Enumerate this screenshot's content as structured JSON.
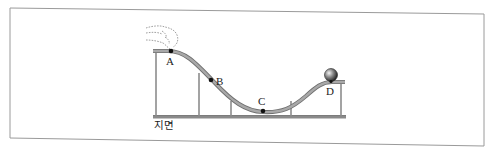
{
  "diagram": {
    "type": "roller-coaster track diagram",
    "points": [
      {
        "id": "A",
        "label": "A",
        "description": "start point on top-left platform, hand releasing ball"
      },
      {
        "id": "B",
        "label": "B",
        "description": "point on descending slope"
      },
      {
        "id": "C",
        "label": "C",
        "description": "lowest point of the track"
      },
      {
        "id": "D",
        "label": "D",
        "description": "top-right platform where ball rests"
      }
    ],
    "ground_label": "지면",
    "objects": {
      "ball": "ball-at-D",
      "hand": "hand-at-A"
    },
    "colors": {
      "track": "#9a9a9a",
      "track_edge": "#6f6f6f",
      "ground": "#7a7a7a",
      "support": "#8c8c8c",
      "frame": "#9a9a9a",
      "point": "#111111",
      "ball_highlight": "#f0f0f0",
      "ball_dark": "#1a1a1a"
    }
  }
}
